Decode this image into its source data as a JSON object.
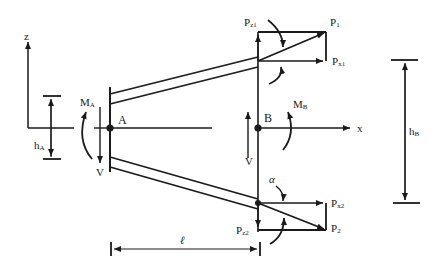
{
  "diagram": {
    "type": "structural free-body diagram",
    "axes": {
      "z_label": "z",
      "x_label": "x"
    },
    "points": {
      "A": {
        "label": "A"
      },
      "B": {
        "label": "B"
      }
    },
    "moments": {
      "MA": {
        "main": "M",
        "sub": "A"
      },
      "MB": {
        "main": "M",
        "sub": "B"
      }
    },
    "shear": {
      "left": "V",
      "right": "V"
    },
    "dimensions": {
      "hA": {
        "main": "h",
        "sub": "A"
      },
      "hB": {
        "main": "h",
        "sub": "B"
      },
      "length": "ℓ"
    },
    "forces": {
      "P1": {
        "main": "P",
        "sub": "1"
      },
      "Pz1": {
        "main": "P",
        "sub": "z1"
      },
      "Px1": {
        "main": "P",
        "sub": "x1"
      },
      "P2": {
        "main": "P",
        "sub": "2"
      },
      "Pz2": {
        "main": "P",
        "sub": "z2"
      },
      "Px2": {
        "main": "P",
        "sub": "x2"
      }
    },
    "angle": "α",
    "colors": {
      "line": "#1a1a1a",
      "background": "#ffffff"
    }
  }
}
